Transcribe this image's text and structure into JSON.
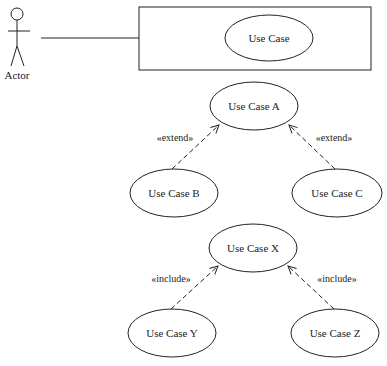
{
  "diagram": {
    "type": "uml-use-case",
    "colors": {
      "stroke": "#222222",
      "background": "#ffffff"
    },
    "actor": {
      "label": "Actor"
    },
    "system_boundary": {
      "use_case": {
        "label": "Use Case"
      }
    },
    "extend_group": {
      "base": {
        "label": "Use Case A"
      },
      "left": {
        "label": "Use Case B"
      },
      "right": {
        "label": "Use Case C"
      },
      "left_stereotype": "«extend»",
      "right_stereotype": "«extend»"
    },
    "include_group": {
      "base": {
        "label": "Use Case X"
      },
      "left": {
        "label": "Use Case Y"
      },
      "right": {
        "label": "Use Case Z"
      },
      "left_stereotype": "«include»",
      "right_stereotype": "«include»"
    }
  }
}
